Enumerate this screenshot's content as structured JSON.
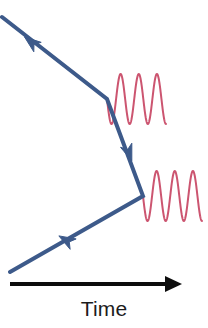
{
  "figure": {
    "kind": "feynman-diagram",
    "title": "",
    "background_color": "#ffffff"
  },
  "axis": {
    "label": "Time",
    "direction": "left-to-right",
    "color": "#0d0d0d",
    "x_start": 10,
    "x_end": 182,
    "y": 284,
    "line_width": 4,
    "arrow_head_length": 17,
    "arrow_head_width": 16
  },
  "fermion": {
    "name": "electron-line",
    "color": "#3d5a8a",
    "line_width": 4,
    "points": [
      {
        "x": 2,
        "y": 17
      },
      {
        "x": 107,
        "y": 99
      },
      {
        "x": 143,
        "y": 196
      },
      {
        "x": 10,
        "y": 272
      }
    ],
    "arrows": [
      {
        "name": "arrow-incoming-upper",
        "x": 31,
        "y": 42,
        "angle_deg": 218,
        "size": 15
      },
      {
        "name": "arrow-internal-middle",
        "x": 129,
        "y": 153,
        "angle_deg": 70,
        "size": 15
      },
      {
        "name": "arrow-outgoing-lower",
        "x": 66,
        "y": 240,
        "angle_deg": 210,
        "size": 15
      }
    ]
  },
  "photons": [
    {
      "name": "photon-upper",
      "color": "#cc5570",
      "line_width": 2,
      "x_start": 107,
      "x_end": 166,
      "y_center": 99,
      "amplitude": 25,
      "cycles": 3.25,
      "phase_deg": 180
    },
    {
      "name": "photon-lower",
      "color": "#cc5570",
      "line_width": 2,
      "x_start": 143,
      "x_end": 202,
      "y_center": 196,
      "amplitude": 25,
      "cycles": 3.25,
      "phase_deg": 180
    }
  ],
  "vertices": [
    {
      "name": "vertex-upper",
      "x": 107,
      "y": 99
    },
    {
      "name": "vertex-lower",
      "x": 143,
      "y": 196
    }
  ]
}
